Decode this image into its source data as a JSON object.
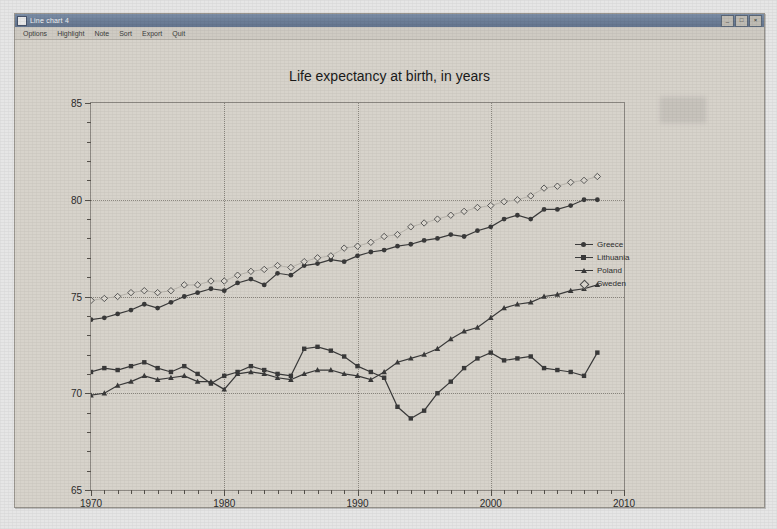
{
  "window": {
    "title": "Line chart 4",
    "icon": "app-icon",
    "buttons": [
      {
        "name": "minimize-button",
        "glyph": "_"
      },
      {
        "name": "maximize-button",
        "glyph": "□"
      },
      {
        "name": "close-button",
        "glyph": "×"
      }
    ]
  },
  "menubar": {
    "items": [
      {
        "name": "menu-options",
        "label": "Options"
      },
      {
        "name": "menu-highlight",
        "label": "Highlight"
      },
      {
        "name": "menu-note",
        "label": "Note"
      },
      {
        "name": "menu-sort",
        "label": "Sort"
      },
      {
        "name": "menu-export",
        "label": "Export"
      },
      {
        "name": "menu-quit",
        "label": "Quit"
      }
    ]
  },
  "chart_data": {
    "type": "line",
    "title": "Life expectancy at birth, in years",
    "xlabel": "",
    "ylabel": "",
    "xlim": [
      1970,
      2010
    ],
    "ylim": [
      65,
      85
    ],
    "xticks": [
      1970,
      1980,
      1990,
      2000,
      2010
    ],
    "yticks": [
      65,
      70,
      75,
      80,
      85
    ],
    "xminor_step": 1,
    "yminor_step": 1,
    "grid": true,
    "legend_position": "right",
    "x": [
      1970,
      1971,
      1972,
      1973,
      1974,
      1975,
      1976,
      1977,
      1978,
      1979,
      1980,
      1981,
      1982,
      1983,
      1984,
      1985,
      1986,
      1987,
      1988,
      1989,
      1990,
      1991,
      1992,
      1993,
      1994,
      1995,
      1996,
      1997,
      1998,
      1999,
      2000,
      2001,
      2002,
      2003,
      2004,
      2005,
      2006,
      2007,
      2008
    ],
    "series": [
      {
        "name": "Greece",
        "marker": "filled-dot",
        "color": "#3a3a3a",
        "values": [
          73.8,
          73.9,
          74.1,
          74.3,
          74.6,
          74.4,
          74.7,
          75.0,
          75.2,
          75.4,
          75.3,
          75.7,
          75.9,
          75.6,
          76.2,
          76.1,
          76.6,
          76.7,
          76.9,
          76.8,
          77.1,
          77.3,
          77.4,
          77.6,
          77.7,
          77.9,
          78.0,
          78.2,
          78.1,
          78.4,
          78.6,
          79.0,
          79.2,
          79.0,
          79.5,
          79.5,
          79.7,
          80.0,
          80.0
        ]
      },
      {
        "name": "Lithuania",
        "marker": "filled-sq",
        "color": "#3a3a3a",
        "values": [
          71.1,
          71.3,
          71.2,
          71.4,
          71.6,
          71.3,
          71.1,
          71.4,
          71.0,
          70.5,
          70.9,
          71.1,
          71.4,
          71.2,
          71.0,
          70.9,
          72.3,
          72.4,
          72.2,
          71.9,
          71.4,
          71.1,
          70.8,
          69.3,
          68.7,
          69.1,
          70.0,
          70.6,
          71.3,
          71.8,
          72.1,
          71.7,
          71.8,
          71.9,
          71.3,
          71.2,
          71.1,
          70.9,
          72.1
        ]
      },
      {
        "name": "Poland",
        "marker": "filled-tri",
        "color": "#3a3a3a",
        "values": [
          69.9,
          70.0,
          70.4,
          70.6,
          70.9,
          70.7,
          70.8,
          70.9,
          70.6,
          70.6,
          70.2,
          71.0,
          71.1,
          71.0,
          70.8,
          70.7,
          71.0,
          71.2,
          71.2,
          71.0,
          70.9,
          70.7,
          71.1,
          71.6,
          71.8,
          72.0,
          72.3,
          72.8,
          73.2,
          73.4,
          73.9,
          74.4,
          74.6,
          74.7,
          75.0,
          75.1,
          75.3,
          75.4,
          75.6
        ]
      },
      {
        "name": "Sweden",
        "marker": "open-dia",
        "color": "#4a4a4a",
        "values": [
          74.8,
          74.9,
          75.0,
          75.2,
          75.3,
          75.2,
          75.3,
          75.6,
          75.6,
          75.8,
          75.8,
          76.1,
          76.3,
          76.4,
          76.6,
          76.5,
          76.8,
          77.0,
          77.1,
          77.5,
          77.6,
          77.8,
          78.1,
          78.2,
          78.6,
          78.8,
          79.0,
          79.2,
          79.4,
          79.6,
          79.7,
          79.9,
          80.0,
          80.2,
          80.6,
          80.7,
          80.9,
          81.0,
          81.2
        ]
      }
    ]
  }
}
